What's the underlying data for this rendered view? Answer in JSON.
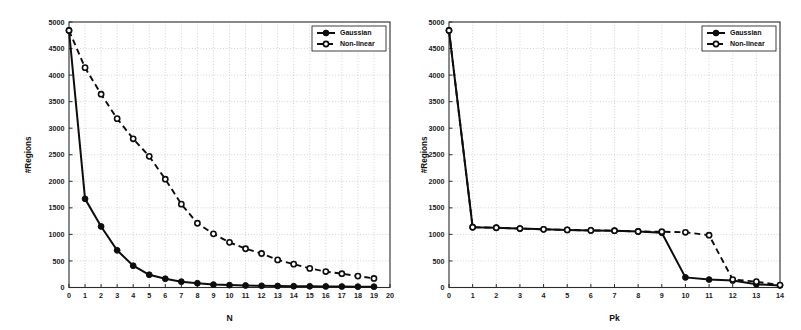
{
  "figure": {
    "background": "#ffffff",
    "series_color": "#0d0d0d",
    "grid_color": "#9a9a9a",
    "axis_color": "#2b2b2b"
  },
  "chart_data": [
    {
      "type": "line",
      "title": "",
      "xlabel": "N",
      "ylabel": "#Regions",
      "xlim": [
        0,
        20
      ],
      "ylim": [
        0,
        5000
      ],
      "xticks": [
        0,
        1,
        2,
        3,
        4,
        5,
        6,
        7,
        8,
        9,
        10,
        11,
        12,
        13,
        14,
        15,
        16,
        17,
        18,
        19,
        20
      ],
      "xticklabels": [
        "0",
        "1",
        "2",
        "3",
        "4",
        "5",
        "6",
        "7",
        "8",
        "9",
        "10",
        "11",
        "12",
        "13",
        "14",
        "15",
        "16",
        "17",
        "18",
        "19",
        "20"
      ],
      "yticks": [
        0,
        500,
        1000,
        1500,
        2000,
        2500,
        3000,
        3500,
        4000,
        4500,
        5000
      ],
      "yticklabels": [
        "0",
        "500",
        "1000",
        "1500",
        "2000",
        "2500",
        "3000",
        "3500",
        "4000",
        "4500",
        "5000"
      ],
      "grid": true,
      "legend_position": "upper right",
      "x": [
        0,
        1,
        2,
        3,
        4,
        5,
        6,
        7,
        8,
        9,
        10,
        11,
        12,
        13,
        14,
        15,
        16,
        17,
        18,
        19
      ],
      "series": [
        {
          "name": "Gaussian",
          "linestyle": "solid",
          "marker": "filled-circle",
          "values": [
            4840,
            1670,
            1150,
            700,
            410,
            240,
            165,
            110,
            80,
            55,
            45,
            38,
            32,
            28,
            24,
            22,
            20,
            18,
            16,
            15
          ]
        },
        {
          "name": "Non-linear",
          "linestyle": "dashed",
          "marker": "open-circle",
          "values": [
            4840,
            4140,
            3640,
            3180,
            2800,
            2470,
            2040,
            1570,
            1210,
            1010,
            850,
            730,
            640,
            520,
            440,
            360,
            300,
            260,
            215,
            170
          ]
        }
      ]
    },
    {
      "type": "line",
      "title": "",
      "xlabel": "Pk",
      "ylabel": "#Regions",
      "xlim": [
        0,
        14
      ],
      "ylim": [
        0,
        5000
      ],
      "xticks": [
        0,
        1,
        2,
        3,
        4,
        5,
        6,
        7,
        8,
        9,
        10,
        11,
        12,
        13,
        14
      ],
      "xticklabels": [
        "0",
        "1",
        "2",
        "3",
        "4",
        "5",
        "6",
        "7",
        "8",
        "9",
        "10",
        "11",
        "12",
        "13",
        "14"
      ],
      "yticks": [
        0,
        500,
        1000,
        1500,
        2000,
        2500,
        3000,
        3500,
        4000,
        4500,
        5000
      ],
      "yticklabels": [
        "0",
        "500",
        "1000",
        "1500",
        "2000",
        "2500",
        "3000",
        "3500",
        "4000",
        "4500",
        "5000"
      ],
      "grid": true,
      "legend_position": "upper right",
      "x": [
        0,
        1,
        2,
        3,
        4,
        5,
        6,
        7,
        8,
        9,
        10,
        11,
        12,
        13,
        14
      ],
      "series": [
        {
          "name": "Gaussian",
          "linestyle": "solid",
          "marker": "filled-circle",
          "values": [
            4840,
            1135,
            1125,
            1110,
            1095,
            1085,
            1075,
            1070,
            1055,
            1030,
            190,
            150,
            130,
            60,
            40
          ]
        },
        {
          "name": "Non-linear",
          "linestyle": "dashed",
          "marker": "open-circle",
          "values": [
            4840,
            1135,
            1125,
            1110,
            1095,
            1085,
            1075,
            1070,
            1055,
            1050,
            1040,
            985,
            150,
            110,
            45
          ]
        }
      ]
    }
  ],
  "panels": [
    {
      "name": "left-plot",
      "legend": {
        "entries": [
          "Gaussian",
          "Non-linear"
        ]
      }
    },
    {
      "name": "right-plot",
      "legend": {
        "entries": [
          "Gaussian",
          "Non-linear"
        ]
      }
    }
  ]
}
